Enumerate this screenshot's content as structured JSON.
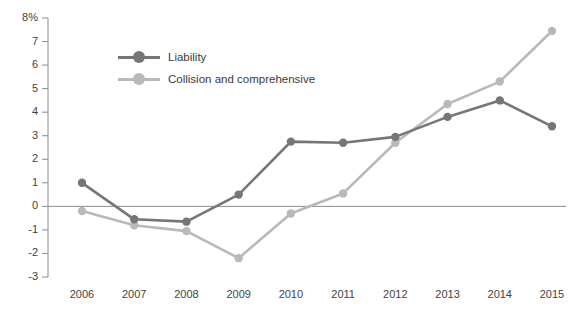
{
  "chart_data": {
    "type": "line",
    "title": "",
    "xlabel": "",
    "ylabel": "",
    "categories": [
      "2006",
      "2007",
      "2008",
      "2009",
      "2010",
      "2011",
      "2012",
      "2013",
      "2014",
      "2015"
    ],
    "ylim": [
      -3,
      8
    ],
    "yticks": [
      "8%",
      "7",
      "6",
      "5",
      "4",
      "3",
      "2",
      "1",
      "0",
      "-1",
      "-2",
      "-3"
    ],
    "ytick_values": [
      8,
      7,
      6,
      5,
      4,
      3,
      2,
      1,
      0,
      -1,
      -2,
      -3
    ],
    "grid": false,
    "legend_position": "upper-left-inside",
    "zero_line": true,
    "series": [
      {
        "name": "Liability",
        "color": "#767676",
        "values": [
          1.0,
          -0.55,
          -0.65,
          0.5,
          2.75,
          2.7,
          2.95,
          3.8,
          4.5,
          3.4
        ]
      },
      {
        "name": "Collision and comprehensive",
        "color": "#b9b9b9",
        "values": [
          -0.2,
          -0.8,
          -1.05,
          -2.2,
          -0.3,
          0.55,
          2.7,
          4.35,
          5.3,
          7.45
        ]
      }
    ]
  },
  "legend": {
    "items": [
      {
        "label": "Liability",
        "color": "#767676"
      },
      {
        "label": "Collision and comprehensive",
        "color": "#b9b9b9"
      }
    ]
  },
  "axis": {
    "y_ticks": [
      "8%",
      "7",
      "6",
      "5",
      "4",
      "3",
      "2",
      "1",
      "0",
      "-1",
      "-2",
      "-3"
    ],
    "x_ticks": [
      "2006",
      "2007",
      "2008",
      "2009",
      "2010",
      "2011",
      "2012",
      "2013",
      "2014",
      "2015"
    ]
  },
  "colors": {
    "liability": "#767676",
    "collision": "#b9b9b9",
    "axis": "#7a7a7a",
    "text": "#3f3f3f"
  }
}
